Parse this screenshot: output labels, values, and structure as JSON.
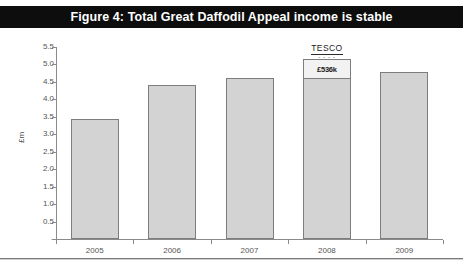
{
  "top_clip": {
    "ghost_text": "· · · · · ·"
  },
  "title": {
    "text": "Figure 4: Total Great Daffodil Appeal income is stable"
  },
  "colors": {
    "title_bar_bg": "#0d0d0d",
    "title_text": "#ffffff",
    "bar_fill": "#d3d3d3",
    "bar_border": "#7d7d7d",
    "segment_fill": "#f2f2f2",
    "axis": "#8a8a8a",
    "tick_text": "#555555"
  },
  "annotations": {
    "tesco": {
      "word": "TESCO",
      "dashes": "- - - -"
    },
    "segment_value": "£536k"
  },
  "chart_data": {
    "type": "bar",
    "title": "Figure 4: Total Great Daffodil Appeal income is stable",
    "xlabel": "",
    "ylabel": "£m",
    "categories": [
      "2005",
      "2006",
      "2007",
      "2008",
      "2009"
    ],
    "values": [
      3.45,
      4.42,
      4.62,
      5.15,
      4.78
    ],
    "stacked": true,
    "series": [
      {
        "name": "Appeal income (base)",
        "values": [
          3.45,
          4.42,
          4.62,
          4.61,
          4.78
        ]
      },
      {
        "name": "Tesco contribution",
        "values": [
          0,
          0,
          0,
          0.536,
          0
        ],
        "data_labels": [
          "",
          "",
          "",
          "£536k",
          ""
        ]
      }
    ],
    "ylim": [
      0,
      5.5
    ],
    "yticks": [
      0,
      0.5,
      1.0,
      1.5,
      2.0,
      2.5,
      3.0,
      3.5,
      4.0,
      4.5,
      5.0,
      5.5
    ],
    "ytick_labels": [
      "-",
      "0.5",
      "1.0",
      "1.5",
      "2.0",
      "2.5",
      "3.0",
      "3.5",
      "4.0",
      "4.5",
      "5.0",
      "5.5"
    ],
    "grid": false,
    "legend": "none",
    "annotations": [
      {
        "text": "TESCO",
        "attached_to": "2008",
        "position": "above-bar"
      },
      {
        "text": "£536k",
        "attached_to": "2008",
        "position": "in-top-segment"
      }
    ]
  }
}
